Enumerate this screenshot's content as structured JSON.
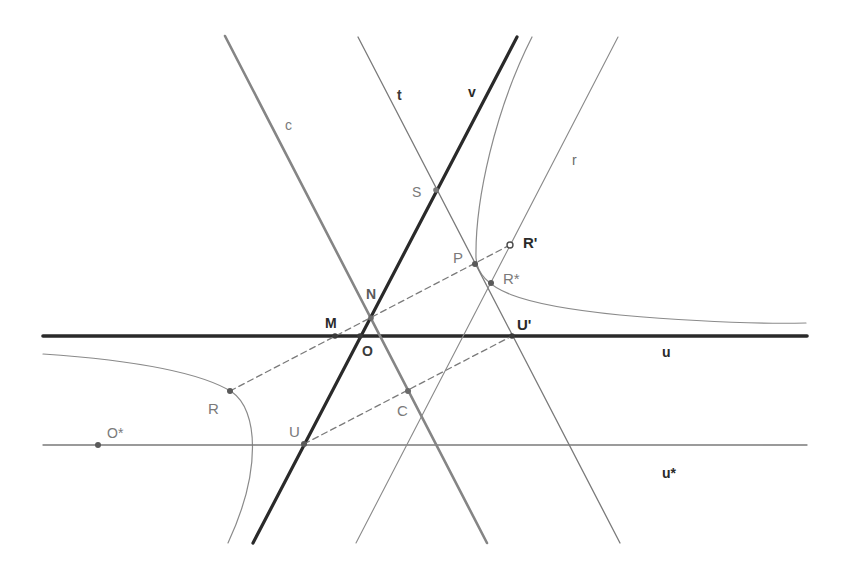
{
  "diagram": {
    "width": 846,
    "height": 580,
    "background": "#ffffff",
    "lines": [
      {
        "id": "u",
        "x1": 43,
        "y1": 336,
        "x2": 807,
        "y2": 336,
        "stroke": "#2a2a2a",
        "width": 3.6,
        "dash": ""
      },
      {
        "id": "u-star",
        "x1": 43,
        "y1": 445,
        "x2": 807,
        "y2": 445,
        "stroke": "#7a7a7a",
        "width": 1.3,
        "dash": ""
      },
      {
        "id": "c",
        "x1": 225,
        "y1": 36,
        "x2": 487,
        "y2": 543,
        "stroke": "#858585",
        "width": 2.6,
        "dash": ""
      },
      {
        "id": "t",
        "x1": 358,
        "y1": 37,
        "x2": 620,
        "y2": 543,
        "stroke": "#7a7a7a",
        "width": 1.3,
        "dash": ""
      },
      {
        "id": "v",
        "x1": 517,
        "y1": 37,
        "x2": 253,
        "y2": 543,
        "stroke": "#2a2a2a",
        "width": 3.2,
        "dash": ""
      },
      {
        "id": "r",
        "x1": 618,
        "y1": 37,
        "x2": 356,
        "y2": 543,
        "stroke": "#8a8a8a",
        "width": 1.1,
        "dash": ""
      },
      {
        "id": "seg-R-Rprime",
        "x1": 230,
        "y1": 391,
        "x2": 510,
        "y2": 245,
        "stroke": "#7a7a7a",
        "width": 1.3,
        "dash": "6,4"
      },
      {
        "id": "seg-U-Uprime",
        "x1": 304,
        "y1": 444,
        "x2": 512,
        "y2": 336,
        "stroke": "#7a7a7a",
        "width": 1.3,
        "dash": "6,4"
      }
    ],
    "curves": [
      {
        "id": "hyperbola-right-branch",
        "d": "M 532 37 C 495 110, 475 200, 476 258 C 478 290, 520 305, 620 315 C 700 322, 760 324, 806 323",
        "stroke": "#8a8a8a",
        "width": 1.2
      },
      {
        "id": "hyperbola-left-branch",
        "d": "M 43 354 C 130 360, 200 372, 232 392 C 258 410, 262 470, 228 543",
        "stroke": "#8a8a8a",
        "width": 1.2
      }
    ],
    "points": [
      {
        "id": "M",
        "x": 335,
        "y": 336,
        "r": 2.8,
        "fill": "#3a3a3a",
        "hollow": false
      },
      {
        "id": "O",
        "x": 360,
        "y": 336,
        "r": 2.8,
        "fill": "#3a3a3a",
        "hollow": false
      },
      {
        "id": "N",
        "x": 371,
        "y": 318,
        "r": 2.8,
        "fill": "#6a6a6a",
        "hollow": false
      },
      {
        "id": "S",
        "x": 436,
        "y": 190,
        "r": 2.8,
        "fill": "#7a7a7a",
        "hollow": false
      },
      {
        "id": "P",
        "x": 475,
        "y": 264,
        "r": 3,
        "fill": "#5a5a5a",
        "hollow": false
      },
      {
        "id": "R-prime",
        "x": 510,
        "y": 245,
        "r": 3,
        "fill": "#ffffff",
        "hollow": true
      },
      {
        "id": "R-star",
        "x": 491,
        "y": 283,
        "r": 3,
        "fill": "#5a5a5a",
        "hollow": false
      },
      {
        "id": "U-prime",
        "x": 512,
        "y": 336,
        "r": 2.8,
        "fill": "#3a3a3a",
        "hollow": false
      },
      {
        "id": "R",
        "x": 230,
        "y": 391,
        "r": 3,
        "fill": "#5a5a5a",
        "hollow": false
      },
      {
        "id": "C",
        "x": 408,
        "y": 391,
        "r": 3,
        "fill": "#6a6a6a",
        "hollow": false
      },
      {
        "id": "U",
        "x": 304,
        "y": 444,
        "r": 3,
        "fill": "#5a5a5a",
        "hollow": false
      },
      {
        "id": "O-star",
        "x": 98,
        "y": 445,
        "r": 3,
        "fill": "#5a5a5a",
        "hollow": false
      }
    ],
    "labels": [
      {
        "id": "label-c",
        "text": "c",
        "x": 285,
        "y": 130,
        "fill": "#7a7a7a",
        "size": 14,
        "weight": "normal"
      },
      {
        "id": "label-t",
        "text": "t",
        "x": 397,
        "y": 100,
        "fill": "#3a3a3a",
        "size": 14,
        "weight": "bold"
      },
      {
        "id": "label-v",
        "text": "v",
        "x": 468,
        "y": 97,
        "fill": "#2a2a2a",
        "size": 14,
        "weight": "bold"
      },
      {
        "id": "label-r",
        "text": "r",
        "x": 572,
        "y": 165,
        "fill": "#6a6a6a",
        "size": 14,
        "weight": "normal"
      },
      {
        "id": "label-S",
        "text": "S",
        "x": 412,
        "y": 197,
        "fill": "#7a7a7a",
        "size": 14,
        "weight": "normal"
      },
      {
        "id": "label-P",
        "text": "P",
        "x": 453,
        "y": 263,
        "fill": "#7a7a7a",
        "size": 15,
        "weight": "normal"
      },
      {
        "id": "label-R-prime",
        "text": "R'",
        "x": 523,
        "y": 248,
        "fill": "#2a2a2a",
        "size": 15,
        "weight": "bold"
      },
      {
        "id": "label-R-star",
        "text": "R*",
        "x": 503,
        "y": 284,
        "fill": "#7a7a7a",
        "size": 15,
        "weight": "normal"
      },
      {
        "id": "label-N",
        "text": "N",
        "x": 366,
        "y": 299,
        "fill": "#5a5a5a",
        "size": 14,
        "weight": "bold"
      },
      {
        "id": "label-M",
        "text": "M",
        "x": 325,
        "y": 328,
        "fill": "#2a2a2a",
        "size": 14,
        "weight": "bold"
      },
      {
        "id": "label-O",
        "text": "O",
        "x": 362,
        "y": 356,
        "fill": "#3a3a3a",
        "size": 14,
        "weight": "bold"
      },
      {
        "id": "label-U-prime",
        "text": "U'",
        "x": 517,
        "y": 330,
        "fill": "#2a2a2a",
        "size": 15,
        "weight": "bold"
      },
      {
        "id": "label-u",
        "text": "u",
        "x": 662,
        "y": 357,
        "fill": "#2a2a2a",
        "size": 14,
        "weight": "bold"
      },
      {
        "id": "label-R",
        "text": "R",
        "x": 208,
        "y": 414,
        "fill": "#7a7a7a",
        "size": 15,
        "weight": "normal"
      },
      {
        "id": "label-C",
        "text": "C",
        "x": 397,
        "y": 416,
        "fill": "#7a7a7a",
        "size": 15,
        "weight": "normal"
      },
      {
        "id": "label-U",
        "text": "U",
        "x": 289,
        "y": 437,
        "fill": "#7a7a7a",
        "size": 15,
        "weight": "normal"
      },
      {
        "id": "label-O-star",
        "text": "O*",
        "x": 107,
        "y": 438,
        "fill": "#7a7a7a",
        "size": 14,
        "weight": "normal"
      },
      {
        "id": "label-u-star",
        "text": "u*",
        "x": 662,
        "y": 478,
        "fill": "#2a2a2a",
        "size": 14,
        "weight": "bold"
      }
    ]
  }
}
